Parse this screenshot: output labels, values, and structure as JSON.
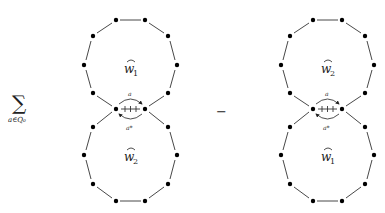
{
  "formula": {
    "sum_symbol": "∑",
    "sum_subscript": "a∈Q₀",
    "operator": "−"
  },
  "diagrams": [
    {
      "id": "left",
      "upper_loop_label": "w",
      "upper_loop_index": "1",
      "lower_loop_label": "w",
      "lower_loop_index": "2",
      "arrow_top_label": "a",
      "arrow_bottom_label": "a*"
    },
    {
      "id": "right",
      "upper_loop_label": "w",
      "upper_loop_index": "2",
      "lower_loop_label": "w",
      "lower_loop_index": "1",
      "arrow_top_label": "a",
      "arrow_bottom_label": "a*"
    }
  ],
  "colors": {
    "vertex": "#000000",
    "edge": "#333333",
    "background": "#ffffff"
  }
}
